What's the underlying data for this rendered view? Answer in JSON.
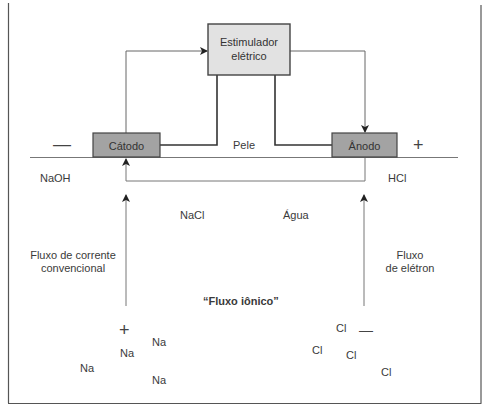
{
  "diagram": {
    "stimulator": {
      "label_line1": "Estimulador",
      "label_line2": "elétrico"
    },
    "cathode": {
      "label": "Cátodo",
      "sign": "—"
    },
    "anode": {
      "label": "Ânodo",
      "sign": "+"
    },
    "skin_label": "Pele",
    "left_solution": "NaOH",
    "right_solution": "HCl",
    "middle_labels": {
      "nacl": "NaCl",
      "water": "Água"
    },
    "conventional_current": {
      "line1": "Fluxo de corrente",
      "line2": "convencional"
    },
    "electron_flow": {
      "line1": "Fluxo",
      "line2": "de elétron"
    },
    "ionic_flow": "“Fluxo iônico”",
    "positive_ions": {
      "sign": "+",
      "items": [
        "Na",
        "Na",
        "Na",
        "Na"
      ]
    },
    "negative_ions": {
      "sign": "—",
      "items": [
        "Cl",
        "Cl",
        "Cl",
        "Cl"
      ]
    },
    "colors": {
      "stimulator_fill": "#e2e2e2",
      "electrode_fill": "#a3a3a3",
      "line": "#555555",
      "wire": "#333333"
    }
  }
}
